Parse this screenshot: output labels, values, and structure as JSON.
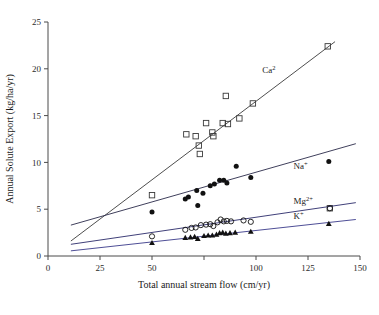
{
  "chart_data": {
    "type": "scatter",
    "title": "",
    "xlabel": "Total annual stream flow (cm/yr)",
    "ylabel": "Annual Solute Export (kg/ha/yr)",
    "xlim": [
      0,
      150
    ],
    "ylim": [
      0,
      25
    ],
    "xticks": [
      0,
      25,
      50,
      75,
      100,
      125,
      150
    ],
    "xtick_labels": [
      "0",
      "25",
      "50",
      "",
      "100",
      "125",
      "150"
    ],
    "yticks": [
      0,
      5,
      10,
      15,
      20,
      25
    ],
    "ytick_labels": [
      "0",
      "5",
      "10",
      "15",
      "20",
      "25"
    ],
    "grid": false,
    "legend_position": "inline-annotations",
    "series": [
      {
        "name": "Ca2",
        "label": "Ca",
        "label_sup": "2",
        "marker": "open-square",
        "color": "#3a3a3a",
        "line_color": "#3a3a3a",
        "label_x": 103,
        "label_y": 19.6,
        "fit_x": [
          11,
          138
        ],
        "fit_y": [
          1.6,
          22.9
        ],
        "points": [
          [
            50.0,
            6.5
          ],
          [
            66.5,
            13.0
          ],
          [
            71.0,
            12.8
          ],
          [
            72.5,
            11.8
          ],
          [
            73.0,
            10.9
          ],
          [
            76.0,
            14.2
          ],
          [
            79.5,
            12.8
          ],
          [
            79.0,
            13.2
          ],
          [
            84.0,
            14.2
          ],
          [
            85.5,
            17.1
          ],
          [
            86.5,
            14.1
          ],
          [
            92.0,
            14.7
          ],
          [
            98.5,
            16.3
          ],
          [
            134.5,
            22.4
          ],
          [
            135.5,
            5.1
          ]
        ]
      },
      {
        "name": "Na+",
        "label": "Na",
        "label_sup": "+",
        "marker": "filled-circle",
        "color": "#111111",
        "line_color": "#2a2a4a",
        "label_x": 118,
        "label_y": 9.3,
        "fit_x": [
          11,
          148
        ],
        "fit_y": [
          3.3,
          12.0
        ],
        "points": [
          [
            50.0,
            4.7
          ],
          [
            66.0,
            6.1
          ],
          [
            67.5,
            6.3
          ],
          [
            71.5,
            7.0
          ],
          [
            72.0,
            5.4
          ],
          [
            74.5,
            6.7
          ],
          [
            78.0,
            7.5
          ],
          [
            80.0,
            7.7
          ],
          [
            82.5,
            8.1
          ],
          [
            84.5,
            8.1
          ],
          [
            86.0,
            7.8
          ],
          [
            90.5,
            9.6
          ],
          [
            97.5,
            8.4
          ],
          [
            135.0,
            10.1
          ]
        ]
      },
      {
        "name": "Mg2+",
        "label": "Mg",
        "label_sup": "2+",
        "marker": "open-circle",
        "color": "#111111",
        "line_color": "#2a2a6a",
        "label_x": 118,
        "label_y": 5.6,
        "fit_x": [
          11,
          148
        ],
        "fit_y": [
          1.25,
          5.7
        ],
        "points": [
          [
            50.0,
            2.1
          ],
          [
            66.0,
            2.8
          ],
          [
            69.0,
            3.0
          ],
          [
            71.0,
            3.05
          ],
          [
            73.5,
            3.3
          ],
          [
            76.0,
            3.35
          ],
          [
            78.0,
            3.4
          ],
          [
            79.5,
            3.2
          ],
          [
            81.5,
            3.6
          ],
          [
            83.0,
            3.9
          ],
          [
            84.5,
            3.7
          ],
          [
            86.0,
            3.75
          ],
          [
            88.0,
            3.7
          ],
          [
            94.0,
            3.8
          ],
          [
            97.5,
            3.65
          ],
          [
            135.5,
            5.1
          ]
        ]
      },
      {
        "name": "K+",
        "label": "K",
        "label_sup": "+",
        "marker": "filled-triangle",
        "color": "#111111",
        "line_color": "#3a3a8a",
        "label_x": 118,
        "label_y": 3.9,
        "fit_x": [
          11,
          148
        ],
        "fit_y": [
          0.55,
          3.9
        ],
        "points": [
          [
            50.0,
            1.4
          ],
          [
            66.0,
            1.95
          ],
          [
            68.5,
            2.0
          ],
          [
            70.5,
            2.05
          ],
          [
            72.0,
            1.85
          ],
          [
            75.0,
            2.15
          ],
          [
            77.0,
            2.2
          ],
          [
            79.0,
            2.2
          ],
          [
            81.0,
            2.3
          ],
          [
            82.5,
            2.45
          ],
          [
            84.0,
            2.5
          ],
          [
            85.5,
            2.4
          ],
          [
            87.5,
            2.45
          ],
          [
            90.0,
            2.5
          ],
          [
            97.5,
            2.6
          ],
          [
            135.0,
            3.45
          ]
        ]
      }
    ]
  }
}
